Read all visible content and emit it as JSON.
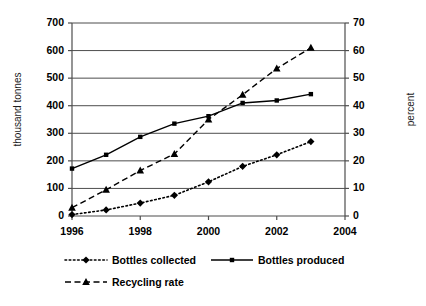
{
  "chart_data": {
    "type": "line",
    "title": "",
    "subtitle": "",
    "xlabel": "",
    "ylabel": "thousand tonnes",
    "y2label": "percent",
    "x": [
      1996,
      1997,
      1998,
      1999,
      2000,
      2001,
      2002,
      2003
    ],
    "xtick_labels": [
      "1996",
      "1998",
      "2000",
      "2002",
      "2004"
    ],
    "xtick_values": [
      1996,
      1998,
      2000,
      2002,
      2004
    ],
    "xlim": [
      1996,
      2004
    ],
    "ylim": [
      0,
      700
    ],
    "y2lim": [
      0,
      70
    ],
    "ytick_labels": [
      "0",
      "100",
      "200",
      "300",
      "400",
      "500",
      "600",
      "700"
    ],
    "ytick_values": [
      0,
      100,
      200,
      300,
      400,
      500,
      600,
      700
    ],
    "y2tick_labels": [
      "0",
      "10",
      "20",
      "30",
      "40",
      "50",
      "60",
      "70"
    ],
    "y2tick_values": [
      0,
      10,
      20,
      30,
      40,
      50,
      60,
      70
    ],
    "grid": true,
    "grid_axis": "y",
    "legend_position": "bottom",
    "series": [
      {
        "name": "Bottles collected",
        "axis": "left",
        "units": "thousand tonnes",
        "marker": "diamond",
        "linestyle": "dotted",
        "color": "#000000",
        "values": [
          5,
          22,
          47,
          75,
          124,
          180,
          222,
          270
        ]
      },
      {
        "name": "Bottles produced",
        "axis": "left",
        "units": "thousand tonnes",
        "marker": "square",
        "linestyle": "solid",
        "color": "#000000",
        "values": [
          172,
          222,
          287,
          335,
          362,
          410,
          419,
          442
        ]
      },
      {
        "name": "Recycling rate",
        "axis": "right",
        "units": "percent",
        "marker": "triangle",
        "linestyle": "dashed",
        "color": "#000000",
        "values": [
          3,
          9.5,
          16.5,
          22.5,
          35,
          44,
          53.5,
          61
        ]
      }
    ]
  },
  "legend": {
    "items": [
      {
        "label": "Bottles collected"
      },
      {
        "label": "Bottles produced"
      },
      {
        "label": "Recycling rate"
      }
    ]
  },
  "axes": {
    "left_title": "thousand tonnes",
    "right_title": "percent"
  }
}
